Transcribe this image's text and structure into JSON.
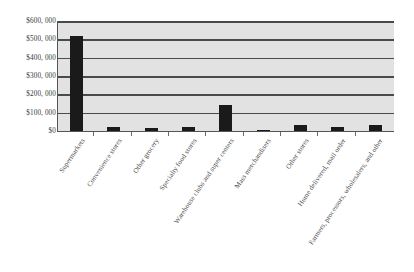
{
  "chart_data": {
    "type": "bar",
    "title": "",
    "subtitle": "",
    "xlabel": "",
    "ylabel": "",
    "categories": [
      "Supermarkets",
      "Convenience stores",
      "Other grocery",
      "Specialty food stores",
      "Warehouse clubs and super centers",
      "Mass merchandisers",
      "Other stores",
      "Home delivered, mail order",
      "Farmers, processors, wholesalers, and other"
    ],
    "values": [
      520000,
      22000,
      18000,
      22000,
      142000,
      3000,
      33000,
      20000,
      33000
    ],
    "ylim": [
      0,
      600000
    ],
    "ytick_values": [
      600000,
      500000,
      400000,
      300000,
      200000,
      100000,
      0
    ],
    "ytick_labels": [
      "$600, 000",
      "$500, 000",
      "$400, 000",
      "$300, 000",
      "$200, 000",
      "$100, 000",
      "$0"
    ],
    "grid": true,
    "legend": false,
    "legend_position": "none",
    "bar_color": "#1a1a1a",
    "plot_background_color": "#e2e2e2",
    "gridline_color": "#4a4a4a",
    "axis_color": "#555555",
    "figure_background_color": "#ffffff"
  }
}
